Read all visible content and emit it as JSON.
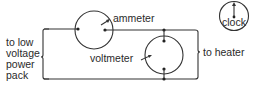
{
  "diagram": {
    "type": "circuit",
    "components": {
      "ammeter": {
        "label": "ammeter"
      },
      "voltmeter": {
        "label": "voltmeter"
      },
      "clock": {
        "label": "clock"
      }
    },
    "connections": {
      "supply": {
        "label_lines": [
          "to low",
          "voltage",
          "power",
          "pack"
        ]
      },
      "load": {
        "label": "to heater"
      }
    },
    "colors": {
      "line": "#333333",
      "text": "#2a2a2a",
      "background": "#ffffff"
    }
  }
}
